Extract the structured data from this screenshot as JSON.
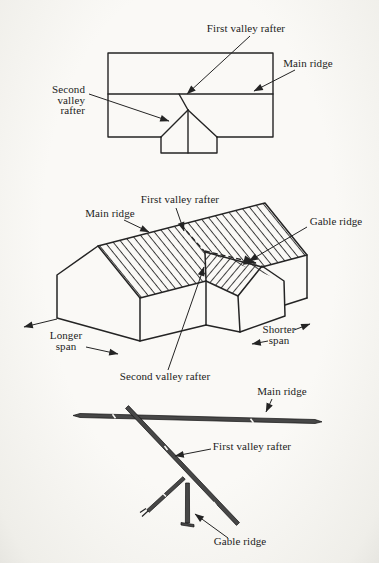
{
  "colors": {
    "ink": "#242424",
    "paper": "#faf9f6",
    "member_fill": "#474747"
  },
  "plan_view": {
    "labels": {
      "first_valley_rafter": "First valley rafter",
      "main_ridge": "Main ridge",
      "second_valley_rafter_line1": "Second",
      "second_valley_rafter_line2": "valley",
      "second_valley_rafter_line3": "rafter"
    }
  },
  "isometric_view": {
    "labels": {
      "first_valley_rafter": "First valley rafter",
      "main_ridge": "Main ridge",
      "gable_ridge": "Gable ridge",
      "longer_span_line1": "Longer",
      "longer_span_line2": "span",
      "shorter_span_line1": "Shorter",
      "shorter_span_line2": "span",
      "second_valley_rafter": "Second valley rafter"
    }
  },
  "member_detail": {
    "labels": {
      "main_ridge": "Main ridge",
      "first_valley_rafter": "First valley rafter",
      "gable_ridge": "Gable ridge"
    }
  }
}
